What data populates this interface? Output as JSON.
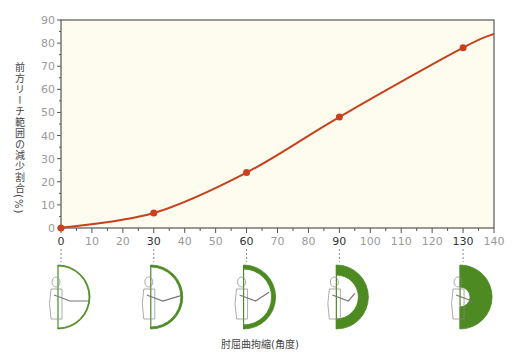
{
  "chart_data": {
    "type": "line",
    "title": "",
    "xlabel": "肘屈曲拘縮(角度)",
    "ylabel": "前方リーチ範囲の減少割合(%)",
    "x": [
      0,
      30,
      60,
      90,
      130
    ],
    "values": [
      0,
      6.5,
      24,
      48,
      78
    ],
    "curve_end": {
      "x": 140,
      "y": 84
    },
    "xlim": [
      0,
      140
    ],
    "ylim": [
      0,
      90
    ],
    "xticks": [
      0,
      10,
      20,
      30,
      40,
      50,
      60,
      70,
      80,
      90,
      100,
      110,
      120,
      130,
      140
    ],
    "yticks": [
      0,
      10,
      20,
      30,
      40,
      50,
      60,
      70,
      80,
      90
    ],
    "highlighted_xticks": [
      0,
      30,
      60,
      90,
      130
    ],
    "grid": false,
    "legend": null,
    "colors": {
      "line": "#c8401c",
      "plot_bg": "#fdfcee",
      "figure_green": "#4e8a22"
    },
    "illustrations": [
      {
        "angle": 0,
        "ring_thickness": 1
      },
      {
        "angle": 30,
        "ring_thickness": 2
      },
      {
        "angle": 60,
        "ring_thickness": 4
      },
      {
        "angle": 90,
        "ring_thickness": 10
      },
      {
        "angle": 130,
        "ring_thickness": 22
      }
    ]
  }
}
